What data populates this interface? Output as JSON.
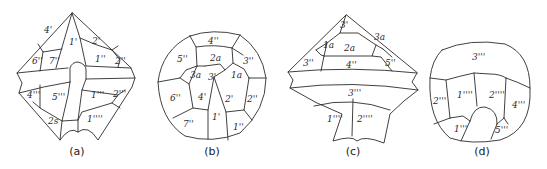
{
  "figure": {
    "panels": [
      {
        "id": "a",
        "caption": "(a)",
        "plates": {
          "p4p": "4'",
          "p1p": "1'",
          "p2p": "2'",
          "p6pp": "6''",
          "p7pp": "7''",
          "p1pp": "1''",
          "p2pp": "2''",
          "p4ppp": "4'''",
          "p5ppp": "5'''",
          "p1ppp": "1'''",
          "p2ppp": "2'''",
          "p2s": "2s",
          "p1pppp": "1''''"
        }
      },
      {
        "id": "b",
        "caption": "(b)",
        "plates": {
          "p4pp": "4''",
          "p5pp": "5''",
          "p2a": "2a",
          "p3pp": "3''",
          "p3a": "3a",
          "p3p": "3'",
          "p1a": "1a",
          "p6pp": "6''",
          "p4p": "4'",
          "p2p": "2'",
          "p2pp": "2''",
          "p7pp": "7''",
          "p1p": "1'",
          "p1pp": "1''"
        }
      },
      {
        "id": "c",
        "caption": "(c)",
        "plates": {
          "p3p": "3'",
          "p1a": "1a",
          "p2a": "2a",
          "p3a": "3a",
          "p3pp": "3''",
          "p4pp": "4''",
          "p5pp": "5''",
          "p3ppp": "3'''",
          "p1pppp": "1''''",
          "p2pppp": "2''''"
        }
      },
      {
        "id": "d",
        "caption": "(d)",
        "plates": {
          "p3ppp": "3'''",
          "p2ppp": "2'''",
          "p1pppp": "1''''",
          "p2pppp": "2''''",
          "p4ppp": "4'''",
          "p1ppp": "1'''",
          "p5ppp": "5'''"
        }
      }
    ]
  }
}
